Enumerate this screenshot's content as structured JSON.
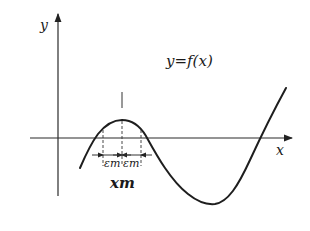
{
  "diagram": {
    "y_axis_label": "y",
    "x_axis_label": "x",
    "function_label": "y=f(x)",
    "epsilon_left": "εm",
    "epsilon_right": "εm",
    "maximum_point_label": "xm",
    "colors": {
      "ink": "#1e1e1e",
      "background": "#ffffff"
    }
  }
}
